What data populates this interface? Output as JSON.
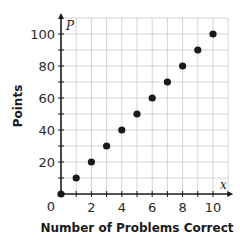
{
  "chart_data": {
    "type": "scatter",
    "title": "",
    "xlabel": "Number of Problems Correct",
    "ylabel": "Points",
    "x_var": "x",
    "y_var": "P",
    "x": [
      0,
      1,
      2,
      3,
      4,
      5,
      6,
      7,
      8,
      9,
      10
    ],
    "y": [
      0,
      10,
      20,
      30,
      40,
      50,
      60,
      70,
      80,
      90,
      100
    ],
    "x_ticks": [
      2,
      4,
      6,
      8,
      10
    ],
    "y_ticks": [
      20,
      40,
      60,
      80,
      100
    ],
    "origin_label": "0",
    "xlim": [
      0,
      11
    ],
    "ylim": [
      0,
      110
    ],
    "grid": true,
    "grid_x_step": 1,
    "grid_y_step": 10,
    "legend": null,
    "colors": {
      "point": "#1a1a1a",
      "axis": "#1a1a1a",
      "grid": "#d4d4d4",
      "frame": "#c8c8c8"
    }
  }
}
